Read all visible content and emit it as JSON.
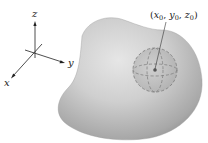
{
  "diagram": {
    "type": "3d-solid-region-with-ball",
    "axes": {
      "x_label": "x",
      "y_label": "y",
      "z_label": "z"
    },
    "point": {
      "label_open": "(",
      "x_var": "x",
      "y_var": "y",
      "z_var": "z",
      "subscript": "0",
      "separator": ", ",
      "label_close": ")",
      "full_label": "(x0, y0, z0)"
    },
    "colors": {
      "solid_light": "#d9d9d9",
      "solid_dark": "#9a9a9a",
      "ball_fill": "#bdbdbd",
      "ball_outline": "#7a7a7a",
      "axes": "#222222",
      "point": "#555555"
    }
  }
}
